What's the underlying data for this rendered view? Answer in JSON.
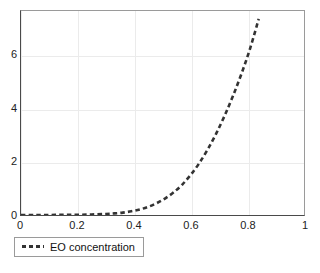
{
  "chart_data": {
    "type": "line",
    "title": "",
    "xlabel": "",
    "ylabel": "",
    "xlim": [
      0,
      1
    ],
    "ylim": [
      0,
      7.7
    ],
    "grid": true,
    "legend_position": "below-axes-left",
    "xticks": [
      "0",
      "0.2",
      "0.4",
      "0.6",
      "0.8",
      "1"
    ],
    "xtick_values": [
      0,
      0.2,
      0.4,
      0.6,
      0.8,
      1
    ],
    "yticks": [
      "0",
      "2",
      "4",
      "6"
    ],
    "ytick_values": [
      0,
      2,
      4,
      6
    ],
    "line_style": "dashed",
    "line_color": "#333333",
    "grid_color": "#ebebeb",
    "axis_color": "#4a4a4a",
    "series": [
      {
        "name": "EO concentration",
        "x": [
          0.0,
          0.05,
          0.1,
          0.15,
          0.2,
          0.25,
          0.3,
          0.33,
          0.36,
          0.39,
          0.42,
          0.45,
          0.48,
          0.51,
          0.54,
          0.57,
          0.6,
          0.63,
          0.66,
          0.69,
          0.72,
          0.75,
          0.78,
          0.81,
          0.84
        ],
        "values": [
          0.0,
          0.0,
          0.0,
          0.01,
          0.01,
          0.02,
          0.04,
          0.06,
          0.09,
          0.14,
          0.21,
          0.31,
          0.45,
          0.63,
          0.86,
          1.15,
          1.52,
          1.96,
          2.48,
          3.08,
          3.76,
          4.52,
          5.36,
          6.3,
          7.4
        ]
      }
    ]
  },
  "legend": {
    "entries": [
      {
        "label": "EO concentration",
        "color": "#333333",
        "style": "dashed"
      }
    ]
  }
}
